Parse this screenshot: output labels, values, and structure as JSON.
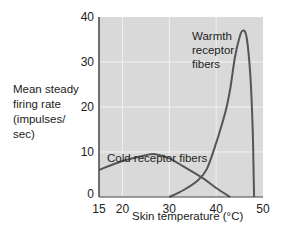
{
  "chart_data": {
    "type": "line",
    "title": "",
    "xlabel": "Skin temperature (°C)",
    "ylabel": "Mean steady firing rate (impulses/ sec)",
    "ylabel_lines": [
      "Mean steady",
      "firing rate",
      "(impulses/",
      "sec)"
    ],
    "xlim": [
      15,
      50
    ],
    "ylim": [
      0,
      40
    ],
    "x_ticks": [
      15,
      20,
      30,
      40,
      50
    ],
    "y_ticks": [
      0,
      10,
      20,
      30,
      40
    ],
    "grid": true,
    "legend": null,
    "series": [
      {
        "name": "Cold receptor fibers",
        "label_lines": [
          "Cold receptor fibers"
        ],
        "x": [
          15,
          20,
          25,
          27,
          30,
          33,
          37,
          40,
          43
        ],
        "y": [
          6,
          8,
          9.3,
          9.5,
          8.6,
          6.8,
          4.3,
          2,
          0
        ]
      },
      {
        "name": "Warmth receptor fibers",
        "label_lines": [
          "Warmth",
          "receptor",
          "fibers"
        ],
        "x": [
          30,
          33,
          36,
          38,
          40,
          42,
          43,
          44,
          45,
          45.7,
          46.5,
          47.3,
          47.8,
          48,
          48.1
        ],
        "y": [
          0,
          1.5,
          3.6,
          6.2,
          12,
          19,
          24,
          31,
          35.5,
          37,
          35.5,
          27,
          15,
          5,
          0
        ]
      }
    ]
  },
  "colors": {
    "plot_background": "#d9d9d9",
    "gridline": "#f2f2f2",
    "curve": "#555555",
    "axis": "#444444"
  }
}
